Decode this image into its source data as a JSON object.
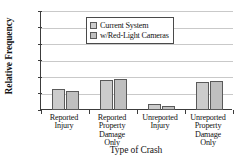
{
  "chart_data": {
    "type": "bar",
    "title": "",
    "xlabel": "Type of Crash",
    "ylabel": "Relative Frequency",
    "categories": [
      "Reported Injury",
      "Reported Property Damage Only",
      "Unreported Injury",
      "Unreported Property Damage Only"
    ],
    "category_lines": [
      [
        "Reported",
        "Injury"
      ],
      [
        "Reported",
        "Property",
        "Damage",
        "Only"
      ],
      [
        "Unreported",
        "Injury"
      ],
      [
        "Unreported",
        "Property",
        "Damage",
        "Only"
      ]
    ],
    "series": [
      {
        "name": "Current System",
        "values": [
          0.26,
          0.36,
          0.07,
          0.34
        ],
        "color": "#cccccc"
      },
      {
        "name": "w/Red-Light Cameras",
        "values": [
          0.23,
          0.37,
          0.05,
          0.35
        ],
        "color": "#bfbfbf"
      }
    ],
    "ylim": [
      0.0,
      1.2
    ],
    "ytick_values": [
      0.0,
      0.2,
      0.4,
      0.6,
      0.8,
      1.0,
      1.2
    ],
    "ytick_labels": [
      "0.00",
      "0.20",
      "0.40",
      "0.60",
      "0.80",
      "1.00",
      "1.20"
    ],
    "grid": true,
    "legend_position": "top-center",
    "legend_entries": [
      "Current System",
      "w/Red-Light Cameras"
    ],
    "bar_border_color": "#5a5a5a",
    "axis_color": "#3c3c3c",
    "grid_color": "#c9c9c9"
  }
}
